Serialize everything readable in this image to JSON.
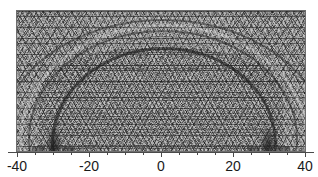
{
  "figure": {
    "title": "",
    "type": "finite-element triangular mesh plot",
    "background_color": "#ffffff",
    "mesh_fill_color": "#a8a8a8",
    "mesh_line_color": "#2d2d2d",
    "axis_color": "#4a4a4a",
    "label_color": "#1a1a1a"
  },
  "chart_data": {
    "type": "heatmap",
    "title": "",
    "xlabel": "",
    "ylabel": "",
    "xlim": [
      -40,
      40
    ],
    "ylim": [
      0,
      39
    ],
    "grid": false,
    "legend": "none",
    "x_ticks_major": [
      -40,
      -20,
      0,
      20,
      40
    ],
    "x_tick_labels": [
      "-40",
      "-20",
      "0",
      "20",
      "40"
    ],
    "x_tick_minor_step": 5,
    "y_axis_visible": false,
    "features": [
      {
        "name": "refinement-source-left",
        "x": -30,
        "y": 0
      },
      {
        "name": "refinement-source-right",
        "x": 30,
        "y": 0
      },
      {
        "name": "arc-front-outer",
        "radius": 40
      },
      {
        "name": "arc-front-middle",
        "radius": 33
      },
      {
        "name": "arc-front-inner",
        "radius": 26
      },
      {
        "name": "arc-front-small",
        "radius": 9
      }
    ]
  },
  "axis": {
    "ticks": [
      {
        "value": -40,
        "label": "-40",
        "x_px": 17,
        "major": true
      },
      {
        "value": -35,
        "label": "",
        "x_px": 35,
        "major": false
      },
      {
        "value": -30,
        "label": "",
        "x_px": 53,
        "major": false
      },
      {
        "value": -25,
        "label": "",
        "x_px": 71,
        "major": false
      },
      {
        "value": -20,
        "label": "-20",
        "x_px": 89,
        "major": true
      },
      {
        "value": -15,
        "label": "",
        "x_px": 107,
        "major": false
      },
      {
        "value": -10,
        "label": "",
        "x_px": 125,
        "major": false
      },
      {
        "value": -5,
        "label": "",
        "x_px": 143,
        "major": false
      },
      {
        "value": 0,
        "label": "0",
        "x_px": 161,
        "major": true
      },
      {
        "value": 5,
        "label": "",
        "x_px": 179,
        "major": false
      },
      {
        "value": 10,
        "label": "",
        "x_px": 197,
        "major": false
      },
      {
        "value": 15,
        "label": "",
        "x_px": 215,
        "major": false
      },
      {
        "value": 20,
        "label": "20",
        "x_px": 233,
        "major": true
      },
      {
        "value": 25,
        "label": "",
        "x_px": 251,
        "major": false
      },
      {
        "value": 30,
        "label": "",
        "x_px": 269,
        "major": false
      },
      {
        "value": 35,
        "label": "",
        "x_px": 287,
        "major": false
      },
      {
        "value": 40,
        "label": "40",
        "x_px": 305,
        "major": true
      }
    ]
  }
}
